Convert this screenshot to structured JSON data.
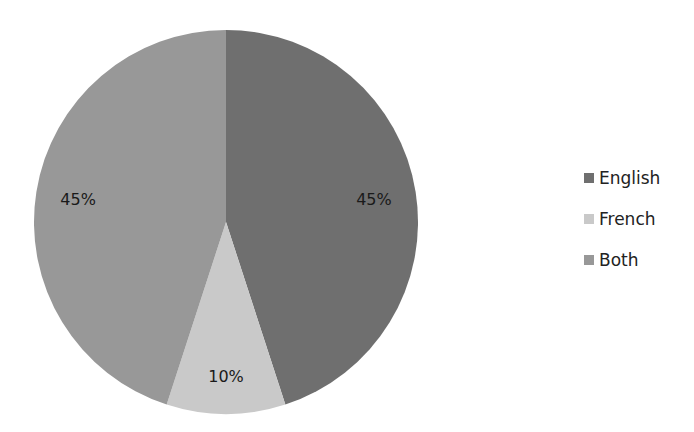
{
  "chart_data": {
    "type": "pie",
    "title": "",
    "categories": [
      "English",
      "French",
      "Both"
    ],
    "values": [
      45,
      10,
      45
    ],
    "labels": [
      "45%",
      "10%",
      "45%"
    ],
    "colors": [
      "#6f6f6f",
      "#c9c9c9",
      "#989898"
    ],
    "start_angle_deg": 0,
    "direction": "clockwise",
    "legend_position": "right"
  },
  "legend": {
    "items": [
      {
        "label": "English",
        "color": "#6f6f6f"
      },
      {
        "label": "French",
        "color": "#c9c9c9"
      },
      {
        "label": "Both",
        "color": "#989898"
      }
    ]
  }
}
